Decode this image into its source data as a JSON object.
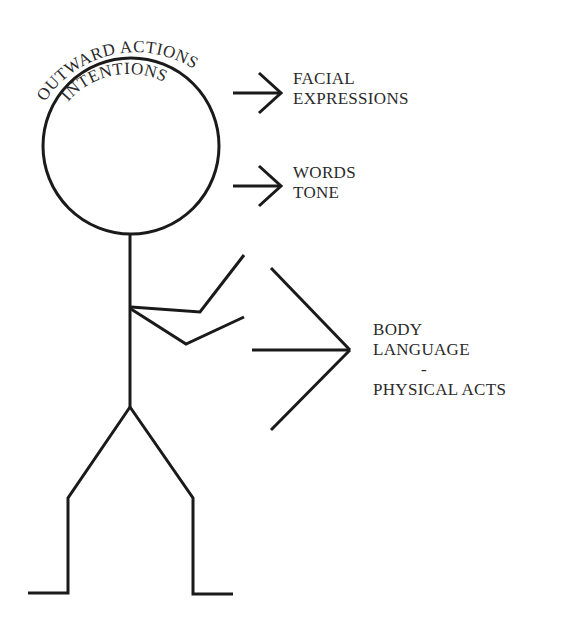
{
  "diagram": {
    "head": {
      "outer_arc_label": "OUTWARD ACTIONS",
      "inner_arc_label": "INTENTIONS"
    },
    "labels": {
      "facial": [
        "FACIAL",
        "EXPRESSIONS"
      ],
      "words": [
        "WORDS",
        "TONE"
      ],
      "body": [
        "BODY",
        "LANGUAGE",
        "-",
        "PHYSICAL ACTS"
      ]
    },
    "colors": {
      "line": "#1a1a1a",
      "text": "#2a2a2a",
      "background": "#ffffff"
    }
  }
}
